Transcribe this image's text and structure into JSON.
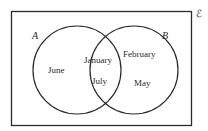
{
  "diagram": {
    "type": "venn",
    "universal_symbol": "ℰ",
    "sets": [
      {
        "name": "A",
        "only": [
          "June"
        ]
      },
      {
        "name": "B",
        "only": [
          "February",
          "May"
        ]
      }
    ],
    "intersection": [
      "January",
      "July"
    ],
    "labels": {
      "set_a": "A",
      "set_b": "B",
      "june": "June",
      "january": "January",
      "july": "July",
      "february": "February",
      "may": "May"
    },
    "colors": {
      "stroke": "#2a2a2a",
      "background": "#ffffff"
    }
  }
}
